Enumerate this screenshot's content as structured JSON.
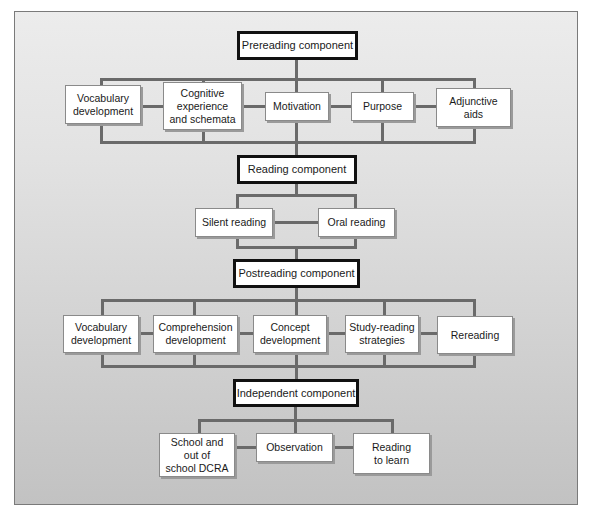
{
  "diagram": {
    "type": "flowchart",
    "components": [
      {
        "id": "prereading",
        "label": "Prereading component",
        "items": [
          "Vocabulary\ndevelopment",
          "Cognitive\nexperience\nand schemata",
          "Motivation",
          "Purpose",
          "Adjunctive\naids"
        ]
      },
      {
        "id": "reading",
        "label": "Reading component",
        "items": [
          "Silent reading",
          "Oral reading"
        ]
      },
      {
        "id": "postreading",
        "label": "Postreading component",
        "items": [
          "Vocabulary\ndevelopment",
          "Comprehension\ndevelopment",
          "Concept\ndevelopment",
          "Study-reading\nstrategies",
          "Rereading"
        ]
      },
      {
        "id": "independent",
        "label": "Independent component",
        "items": [
          "School and\nout of\nschool DCRA",
          "Observation",
          "Reading\nto learn"
        ]
      }
    ],
    "colors": {
      "connector": "#6a6a6a",
      "component_border": "#111111",
      "item_border": "#8a8a8a",
      "box_fill": "#ffffff",
      "background_top": "#ececec",
      "background_bottom": "#c2c2c2"
    }
  }
}
